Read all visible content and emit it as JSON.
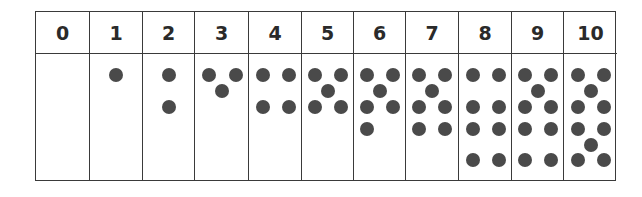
{
  "dot_color": "#4a4a4a",
  "columns": [
    {
      "label": "0",
      "count": 0,
      "left": 0,
      "width": 53,
      "dots": []
    },
    {
      "label": "1",
      "count": 1,
      "left": 53,
      "width": 53,
      "dots": [
        [
          26,
          21
        ]
      ]
    },
    {
      "label": "2",
      "count": 2,
      "left": 106,
      "width": 52,
      "dots": [
        [
          26,
          21
        ],
        [
          26,
          53
        ]
      ]
    },
    {
      "label": "3",
      "count": 3,
      "left": 158,
      "width": 54,
      "dots": [
        [
          14,
          21
        ],
        [
          41,
          21
        ],
        [
          27,
          37
        ]
      ]
    },
    {
      "label": "4",
      "count": 4,
      "left": 212,
      "width": 53,
      "dots": [
        [
          14,
          21
        ],
        [
          40,
          21
        ],
        [
          14,
          53
        ],
        [
          40,
          53
        ]
      ]
    },
    {
      "label": "5",
      "count": 5,
      "left": 265,
      "width": 52,
      "dots": [
        [
          13,
          21
        ],
        [
          39,
          21
        ],
        [
          26,
          37
        ],
        [
          13,
          53
        ],
        [
          39,
          53
        ]
      ]
    },
    {
      "label": "6",
      "count": 6,
      "left": 317,
      "width": 52,
      "dots": [
        [
          13,
          21
        ],
        [
          39,
          21
        ],
        [
          26,
          37
        ],
        [
          13,
          53
        ],
        [
          39,
          53
        ],
        [
          13,
          75
        ]
      ]
    },
    {
      "label": "7",
      "count": 7,
      "left": 369,
      "width": 53,
      "dots": [
        [
          13,
          21
        ],
        [
          39,
          21
        ],
        [
          26,
          37
        ],
        [
          13,
          53
        ],
        [
          39,
          53
        ],
        [
          13,
          75
        ],
        [
          39,
          75
        ]
      ]
    },
    {
      "label": "8",
      "count": 8,
      "left": 422,
      "width": 53,
      "dots": [
        [
          14,
          21
        ],
        [
          40,
          21
        ],
        [
          14,
          53
        ],
        [
          40,
          53
        ],
        [
          14,
          75
        ],
        [
          40,
          75
        ],
        [
          14,
          106
        ],
        [
          40,
          106
        ]
      ]
    },
    {
      "label": "9",
      "count": 9,
      "left": 475,
      "width": 52,
      "dots": [
        [
          13,
          21
        ],
        [
          39,
          21
        ],
        [
          26,
          37
        ],
        [
          13,
          53
        ],
        [
          39,
          53
        ],
        [
          13,
          75
        ],
        [
          39,
          75
        ],
        [
          13,
          106
        ],
        [
          39,
          106
        ]
      ]
    },
    {
      "label": "10",
      "count": 10,
      "left": 527,
      "width": 54,
      "dots": [
        [
          14,
          21
        ],
        [
          40,
          21
        ],
        [
          27,
          37
        ],
        [
          14,
          53
        ],
        [
          40,
          53
        ],
        [
          14,
          75
        ],
        [
          40,
          75
        ],
        [
          27,
          91
        ],
        [
          14,
          106
        ],
        [
          40,
          106
        ]
      ]
    }
  ]
}
